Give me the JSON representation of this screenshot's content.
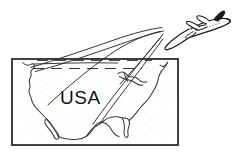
{
  "illustration": {
    "title": "USA map with departing jet airplane and flight path trails",
    "style": "black-and-white line art clipart",
    "background_color": "#ffffff",
    "ink_color": "#1a1a1a",
    "stipple_color": "#9a9a9a"
  },
  "map": {
    "label": "USA",
    "label_color": "#111111",
    "frame": {
      "name": "map-border-rectangle",
      "x": 12,
      "y": 59,
      "width": 166,
      "height": 86,
      "stroke_color": "#1a1a1a",
      "stroke_width": 1.6,
      "fill_color": "#ffffff"
    },
    "coastline_color": "#3a3a3a",
    "regions": [
      "west-coast",
      "baja-california",
      "gulf-of-mexico",
      "florida-peninsula",
      "east-coast",
      "great-lakes",
      "northeast"
    ]
  },
  "airplane": {
    "name": "jet-airplane",
    "heading": "up-right",
    "body_fill": "#ffffff",
    "outline_color": "#1a1a1a",
    "window_row_color": "#6a6a6a",
    "tail_fill": "#1a1a1a",
    "position": {
      "x": 155,
      "y": 9,
      "width": 76,
      "height": 41
    }
  },
  "trails": {
    "name": "flight-path-trails",
    "count": 4,
    "color": "#2a2a2a",
    "stroke_width": 0.9,
    "description": "four sweeping curved contrail lines converging from the map toward the airplane"
  },
  "dashed_guides": {
    "name": "horizon-dashed-lines",
    "count": 2,
    "color": "#2a2a2a"
  }
}
